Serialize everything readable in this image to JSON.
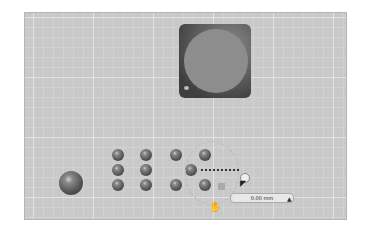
{
  "viewport": {
    "background": "#c9c9c9",
    "grid": "major and minor gridlines"
  },
  "objects": {
    "panel": {
      "type": "rounded square with disc",
      "color": "#3e3e3e"
    },
    "large_sphere": {
      "type": "sphere"
    },
    "small_spheres_count": 11
  },
  "gizmo": {
    "dimension_label": "0.00 mm",
    "icons": [
      "move-icon",
      "cursor-icon",
      "lock-icon"
    ]
  }
}
